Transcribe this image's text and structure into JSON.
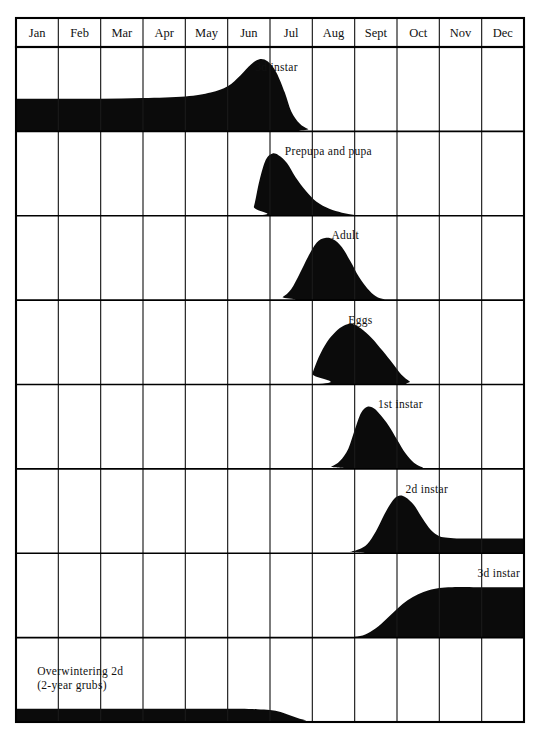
{
  "figure": {
    "ink_color": "#0b0b0b",
    "background_color": "#ffffff"
  },
  "axis": {
    "months": [
      "Jan",
      "Feb",
      "Mar",
      "Apr",
      "May",
      "Jun",
      "Jul",
      "Aug",
      "Sept",
      "Oct",
      "Nov",
      "Dec"
    ]
  },
  "rows": [
    {
      "label": "3d instar",
      "label_x_month": 5.65,
      "label_anchor": "start",
      "label_y_frac": 0.28
    },
    {
      "label": "Prepupa and pupa",
      "label_x_month": 6.35,
      "label_anchor": "start",
      "label_y_frac": 0.28
    },
    {
      "label": "Adult",
      "label_x_month": 7.45,
      "label_anchor": "start",
      "label_y_frac": 0.28
    },
    {
      "label": "Eggs",
      "label_x_month": 7.85,
      "label_anchor": "start",
      "label_y_frac": 0.28
    },
    {
      "label": "1st instar",
      "label_x_month": 8.55,
      "label_anchor": "start",
      "label_y_frac": 0.28
    },
    {
      "label": "2d instar",
      "label_x_month": 9.2,
      "label_anchor": "start",
      "label_y_frac": 0.28
    },
    {
      "label": "3d instar",
      "label_x_month": 10.9,
      "label_anchor": "start",
      "label_y_frac": 0.28
    },
    {
      "label": "Overwintering 2d",
      "label_line2": "(2-year grubs)",
      "label_x_month": 0.5,
      "label_anchor": "start",
      "label_y_frac": 0.44
    }
  ],
  "chart_data": {
    "type": "area",
    "xlabel": "Month",
    "ylabel": "Relative abundance",
    "x": [
      "Jan",
      "Feb",
      "Mar",
      "Apr",
      "May",
      "Jun",
      "Jul",
      "Aug",
      "Sept",
      "Oct",
      "Nov",
      "Dec"
    ],
    "xlim": [
      0,
      12
    ],
    "ylim": [
      0,
      1
    ],
    "grid": true,
    "legend": "inline-annotations",
    "note": "Each panel is a separate life-stage band; y values are relative abundance 0-1 sampled at month fractions (0 = Jan 1, 12 = Dec 31).",
    "series": [
      {
        "name": "3d instar",
        "panel": 0,
        "points": [
          [
            0.0,
            0.42
          ],
          [
            1.0,
            0.42
          ],
          [
            2.0,
            0.42
          ],
          [
            3.0,
            0.43
          ],
          [
            4.0,
            0.45
          ],
          [
            4.6,
            0.5
          ],
          [
            5.0,
            0.58
          ],
          [
            5.3,
            0.72
          ],
          [
            5.55,
            0.86
          ],
          [
            5.75,
            0.93
          ],
          [
            5.95,
            0.9
          ],
          [
            6.15,
            0.76
          ],
          [
            6.35,
            0.5
          ],
          [
            6.5,
            0.26
          ],
          [
            6.7,
            0.1
          ],
          [
            6.9,
            0.03
          ],
          [
            7.1,
            0.0
          ],
          [
            12.0,
            0.0
          ]
        ]
      },
      {
        "name": "Prepupa and pupa",
        "panel": 1,
        "points": [
          [
            0.0,
            0.0
          ],
          [
            5.5,
            0.0
          ],
          [
            5.62,
            0.12
          ],
          [
            5.75,
            0.45
          ],
          [
            5.9,
            0.72
          ],
          [
            6.05,
            0.8
          ],
          [
            6.2,
            0.78
          ],
          [
            6.4,
            0.68
          ],
          [
            6.6,
            0.5
          ],
          [
            6.85,
            0.32
          ],
          [
            7.1,
            0.18
          ],
          [
            7.4,
            0.09
          ],
          [
            7.7,
            0.04
          ],
          [
            8.0,
            0.01
          ],
          [
            8.3,
            0.0
          ],
          [
            12.0,
            0.0
          ]
        ]
      },
      {
        "name": "Adult",
        "panel": 2,
        "points": [
          [
            0.0,
            0.0
          ],
          [
            6.1,
            0.0
          ],
          [
            6.3,
            0.04
          ],
          [
            6.5,
            0.14
          ],
          [
            6.7,
            0.34
          ],
          [
            6.9,
            0.56
          ],
          [
            7.1,
            0.74
          ],
          [
            7.3,
            0.8
          ],
          [
            7.5,
            0.78
          ],
          [
            7.7,
            0.68
          ],
          [
            7.9,
            0.5
          ],
          [
            8.1,
            0.3
          ],
          [
            8.3,
            0.15
          ],
          [
            8.5,
            0.05
          ],
          [
            8.7,
            0.01
          ],
          [
            8.9,
            0.0
          ],
          [
            12.0,
            0.0
          ]
        ]
      },
      {
        "name": "Eggs",
        "panel": 3,
        "points": [
          [
            0.0,
            0.0
          ],
          [
            6.9,
            0.0
          ],
          [
            7.0,
            0.14
          ],
          [
            7.15,
            0.35
          ],
          [
            7.35,
            0.55
          ],
          [
            7.55,
            0.68
          ],
          [
            7.75,
            0.76
          ],
          [
            7.95,
            0.78
          ],
          [
            8.15,
            0.72
          ],
          [
            8.4,
            0.6
          ],
          [
            8.65,
            0.44
          ],
          [
            8.9,
            0.27
          ],
          [
            9.1,
            0.13
          ],
          [
            9.3,
            0.04
          ],
          [
            9.45,
            0.0
          ],
          [
            12.0,
            0.0
          ]
        ]
      },
      {
        "name": "1st instar",
        "panel": 4,
        "points": [
          [
            0.0,
            0.0
          ],
          [
            7.2,
            0.0
          ],
          [
            7.45,
            0.03
          ],
          [
            7.65,
            0.1
          ],
          [
            7.85,
            0.26
          ],
          [
            8.0,
            0.5
          ],
          [
            8.15,
            0.72
          ],
          [
            8.3,
            0.8
          ],
          [
            8.45,
            0.78
          ],
          [
            8.6,
            0.7
          ],
          [
            8.8,
            0.56
          ],
          [
            9.0,
            0.38
          ],
          [
            9.2,
            0.2
          ],
          [
            9.4,
            0.08
          ],
          [
            9.6,
            0.02
          ],
          [
            9.8,
            0.0
          ],
          [
            12.0,
            0.0
          ]
        ]
      },
      {
        "name": "2d instar",
        "panel": 5,
        "points": [
          [
            0.0,
            0.0
          ],
          [
            7.6,
            0.0
          ],
          [
            7.9,
            0.02
          ],
          [
            8.1,
            0.05
          ],
          [
            8.3,
            0.12
          ],
          [
            8.5,
            0.28
          ],
          [
            8.7,
            0.5
          ],
          [
            8.9,
            0.68
          ],
          [
            9.05,
            0.74
          ],
          [
            9.2,
            0.72
          ],
          [
            9.4,
            0.62
          ],
          [
            9.6,
            0.45
          ],
          [
            9.8,
            0.3
          ],
          [
            10.0,
            0.22
          ],
          [
            10.2,
            0.2
          ],
          [
            10.5,
            0.19
          ],
          [
            11.0,
            0.19
          ],
          [
            11.5,
            0.19
          ],
          [
            12.0,
            0.19
          ]
        ]
      },
      {
        "name": "3d instar",
        "panel": 6,
        "points": [
          [
            0.0,
            0.0
          ],
          [
            7.7,
            0.0
          ],
          [
            8.0,
            0.01
          ],
          [
            8.25,
            0.04
          ],
          [
            8.5,
            0.12
          ],
          [
            8.75,
            0.24
          ],
          [
            9.0,
            0.37
          ],
          [
            9.25,
            0.48
          ],
          [
            9.5,
            0.56
          ],
          [
            9.75,
            0.61
          ],
          [
            10.0,
            0.64
          ],
          [
            10.3,
            0.65
          ],
          [
            10.8,
            0.65
          ],
          [
            11.4,
            0.65
          ],
          [
            12.0,
            0.65
          ]
        ]
      },
      {
        "name": "Overwintering 2d (2-year grubs)",
        "panel": 7,
        "points": [
          [
            0.0,
            0.17
          ],
          [
            1.0,
            0.17
          ],
          [
            2.0,
            0.17
          ],
          [
            3.0,
            0.17
          ],
          [
            4.0,
            0.17
          ],
          [
            4.8,
            0.17
          ],
          [
            5.3,
            0.17
          ],
          [
            5.7,
            0.165
          ],
          [
            6.0,
            0.155
          ],
          [
            6.25,
            0.13
          ],
          [
            6.45,
            0.09
          ],
          [
            6.65,
            0.05
          ],
          [
            6.85,
            0.02
          ],
          [
            7.0,
            0.0
          ],
          [
            12.0,
            0.0
          ]
        ]
      }
    ]
  },
  "geometry": {
    "left": 16,
    "right": 524,
    "header_top": 18,
    "header_bottom": 47,
    "plot_bottom": 722,
    "row_count": 8
  }
}
